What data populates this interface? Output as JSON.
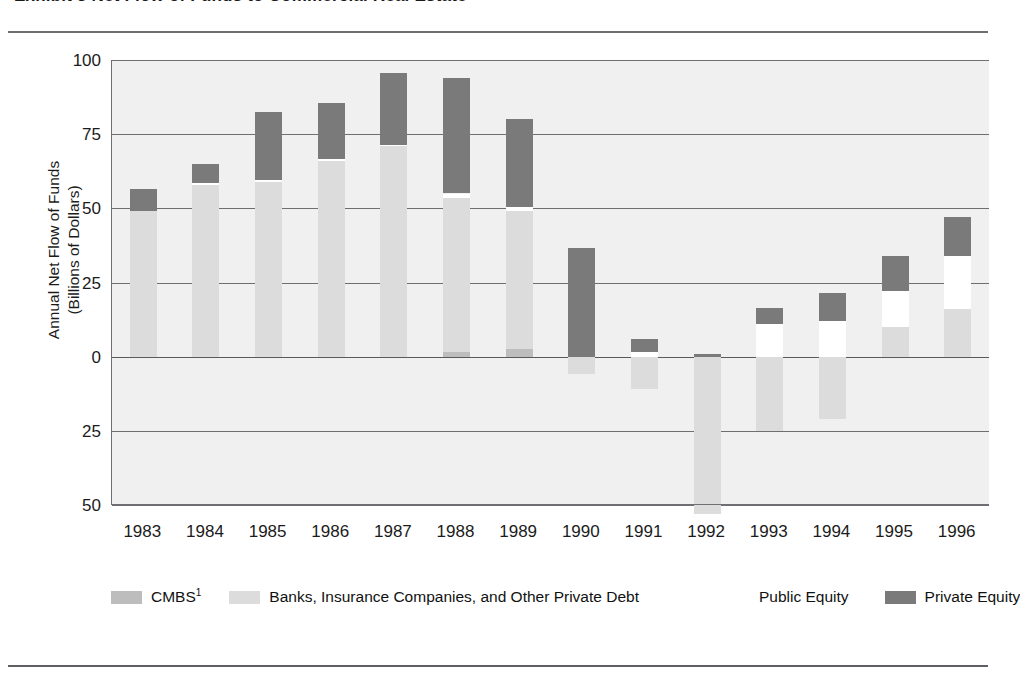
{
  "figure": {
    "title": "Exhibit 3   Net Flow of Funds to Commercial Real Estate",
    "y_axis_title_line1": "Annual Net Flow of Funds",
    "y_axis_title_line2": "(Billions of Dollars)"
  },
  "legend": {
    "items": [
      {
        "key": "cmbs",
        "label": "CMBS",
        "footnote_marker": "1",
        "color": "#bdbdbd"
      },
      {
        "key": "debt",
        "label": "Banks, Insurance Companies, and Other Private Debt",
        "footnote_marker": "",
        "color": "#dcdcdc"
      },
      {
        "key": "pubeq",
        "label": "Public Equity",
        "footnote_marker": "",
        "color": "#ffffff"
      },
      {
        "key": "priveq",
        "label": "Private Equity",
        "footnote_marker": "",
        "color": "#7a7a7a"
      }
    ]
  },
  "chart_data": {
    "type": "bar",
    "stacked": true,
    "title": "Exhibit 3   Net Flow of Funds to Commercial Real Estate",
    "xlabel": "",
    "ylabel": "Annual Net Flow of Funds (Billions of Dollars)",
    "ylim": [
      -50,
      100
    ],
    "yticks": [
      100,
      75,
      50,
      25,
      0,
      25,
      50
    ],
    "ytick_labels": [
      "100",
      "75",
      "50",
      "25",
      "0",
      "25",
      "50"
    ],
    "grid": true,
    "legend_position": "bottom",
    "categories": [
      "1983",
      "1984",
      "1985",
      "1986",
      "1987",
      "1988",
      "1989",
      "1990",
      "1991",
      "1992",
      "1993",
      "1994",
      "1995",
      "1996"
    ],
    "series": [
      {
        "name": "CMBS",
        "color": "#bdbdbd",
        "values": [
          0,
          0,
          0,
          0,
          0,
          1.5,
          2.5,
          0,
          0,
          0,
          0,
          0,
          0,
          0
        ]
      },
      {
        "name": "Banks, Insurance Companies, and Other Private Debt",
        "color": "#dcdcdc",
        "values": [
          49,
          58,
          59,
          66,
          71,
          52,
          46.5,
          -6,
          -11,
          -53,
          -25,
          -21,
          10,
          16
        ]
      },
      {
        "name": "Public Equity",
        "color": "#ffffff",
        "values": [
          0,
          0.5,
          0.5,
          0.5,
          0.5,
          1.5,
          1.5,
          0,
          1.5,
          0,
          11,
          12,
          12,
          18
        ]
      },
      {
        "name": "Private Equity",
        "color": "#7a7a7a",
        "values": [
          7.5,
          6.5,
          23,
          19,
          24,
          39,
          29.5,
          36.5,
          4.5,
          0.8,
          5.5,
          9.5,
          12,
          13
        ]
      }
    ],
    "bar_totals": [
      56.5,
      65,
      82.5,
      85.5,
      95,
      92.5,
      78.5,
      36.5,
      6,
      9,
      27,
      33,
      44.5,
      61.5
    ]
  }
}
